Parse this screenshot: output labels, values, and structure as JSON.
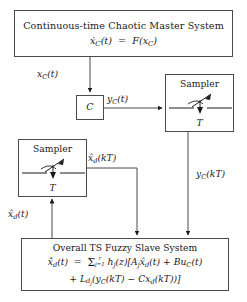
{
  "diagram": {
    "type": "block-diagram",
    "blocks": {
      "master": {
        "name": "Continuous-time Chaotic Master System",
        "title": "Continuous-time Chaotic Master System",
        "equation": "ẋ_C(t) = F(x_C)"
      },
      "output_gain": {
        "name": "C",
        "label": "C"
      },
      "sampler_right": {
        "name": "Sampler",
        "title": "Sampler",
        "period_label": "T"
      },
      "sampler_left": {
        "name": "Sampler",
        "title": "Sampler",
        "period_label": "T"
      },
      "slave": {
        "name": "Overall TS Fuzzy Slave System",
        "title": "Overall TS Fuzzy Slave System",
        "equation_line1": "ẋ̂_d(t) = Σ_{j=1}^{r} h_j(z)[A_j x̂_d(t) + Bu_C(t)",
        "equation_line2": "+ L_{d_j}(y_C(kT) − Cx_d(kT))]"
      }
    },
    "signals": {
      "x_c_t": "x_C(t)",
      "y_c_t": "y_C(t)",
      "y_c_kt": "y_C(kT)",
      "xhat_d_kt": "x̂_d(kT)",
      "xhat_d_t": "x̂_d(t)"
    },
    "colors": {
      "stroke": "#4a4a52",
      "text": "#1a1a1a",
      "background": "#ffffff"
    }
  }
}
